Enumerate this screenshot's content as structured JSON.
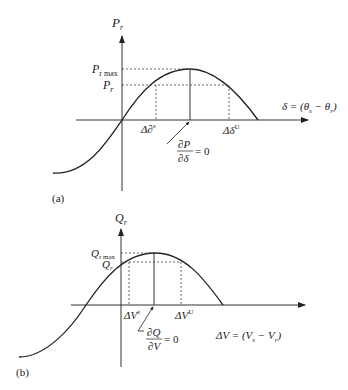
{
  "panel_a": {
    "tag": "(a)",
    "y_axis_label": "P",
    "y_axis_sub": "r",
    "pmax_label": "P",
    "pmax_sub": "r max",
    "pr_label": "P",
    "pr_sub": "r",
    "x_axis_label": "δ = (θ",
    "x_axis_sub1": "s",
    "x_axis_mid": " − θ",
    "x_axis_sub2": "r",
    "x_axis_end": ")",
    "stable_label": "Δ∂",
    "stable_sup": "s",
    "unstable_label": "Δδ",
    "unstable_sup": "U",
    "deriv_num": "∂P",
    "deriv_den": "∂δ",
    "deriv_eq": "= 0"
  },
  "panel_b": {
    "tag": "(b)",
    "y_axis_label": "Q",
    "y_axis_sub": "r",
    "qmax_label": "Q",
    "qmax_sub": "r max",
    "qr_label": "Q",
    "qr_sub": "r",
    "x_axis_label": "ΔV = (V",
    "x_axis_sub1": "s",
    "x_axis_mid": " − V",
    "x_axis_sub2": "r",
    "x_axis_end": ")",
    "stable_label": "ΔV",
    "stable_sup": "s",
    "unstable_label": "ΔV",
    "unstable_sup": "U",
    "deriv_num": "∂Q",
    "deriv_den": "∂V",
    "deriv_eq": "= 0"
  }
}
